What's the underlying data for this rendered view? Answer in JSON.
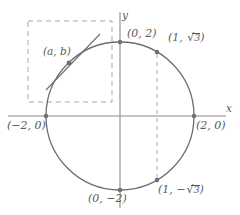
{
  "figure": {
    "type": "coordinate-plane-circle",
    "equation": "x^2 + y^2 = 4",
    "axes": {
      "x_label": "x",
      "y_label": "y"
    },
    "colors": {
      "curve": "#6e6e6e",
      "axis": "#8a8a8a",
      "dashed": "#a8a8a8",
      "text": "#5a5a5a",
      "point": "#6e6e6e",
      "background": "#ffffff"
    },
    "labels": {
      "top": "(0, 2)",
      "bottom": "(0, −2)",
      "left": "(−2, 0)",
      "right": "(2, 0)",
      "tangent_point": "(a, b)",
      "upper_right_prefix": "(1, ",
      "upper_right_radical_num": "3",
      "upper_right_suffix": ")",
      "lower_right_prefix": "(1, −",
      "lower_right_radical_num": "3",
      "lower_right_suffix": ")"
    },
    "points": [
      {
        "name": "top-vertex",
        "label": "(0, 2)",
        "x": 0,
        "y": 2
      },
      {
        "name": "bottom-vertex",
        "label": "(0, −2)",
        "x": 0,
        "y": -2
      },
      {
        "name": "left-vertex",
        "label": "(−2, 0)",
        "x": -2,
        "y": 0
      },
      {
        "name": "right-vertex",
        "label": "(2, 0)",
        "x": 2,
        "y": 0
      },
      {
        "name": "upper-right-point",
        "label": "(1, √3)",
        "x": 1,
        "y": 1.732
      },
      {
        "name": "lower-right-point",
        "label": "(1, −√3)",
        "x": 1,
        "y": -1.732
      },
      {
        "name": "tangent-point",
        "label": "(a, b)",
        "x": -1.4,
        "y": 1.43
      }
    ],
    "circle": {
      "center_x": 0,
      "center_y": 0,
      "radius": 2
    },
    "dashed_rectangle": {
      "x_min": -2.5,
      "y_min": 0,
      "x_max": -0.2,
      "y_max": 2.55
    },
    "dashed_vertical_line": {
      "x": 1,
      "y_from": 1.732,
      "y_to": -1.732
    }
  }
}
